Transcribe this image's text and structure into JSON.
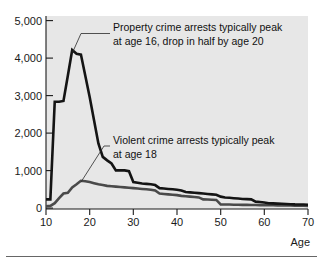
{
  "chart_data": {
    "type": "line",
    "title": "",
    "xlabel": "Age",
    "ylabel": "",
    "xlim": [
      10,
      70
    ],
    "ylim": [
      0,
      5000
    ],
    "grid": false,
    "legend_position": "none",
    "x_ticks": [
      "10",
      "20",
      "30",
      "40",
      "50",
      "60",
      "70"
    ],
    "x_tick_values": [
      10,
      20,
      30,
      40,
      50,
      60,
      70
    ],
    "y_ticks": [
      "0",
      "1,000",
      "2,000",
      "3,000",
      "4,000",
      "5,000"
    ],
    "y_tick_values": [
      0,
      1000,
      2000,
      3000,
      4000,
      5000
    ],
    "x": [
      10,
      11,
      12,
      13,
      14,
      15,
      16,
      17,
      18,
      19,
      20,
      21,
      22,
      23,
      24,
      25,
      26,
      27,
      28,
      29,
      30,
      31,
      32,
      33,
      34,
      35,
      36,
      37,
      38,
      39,
      40,
      41,
      42,
      43,
      44,
      45,
      46,
      47,
      48,
      49,
      50,
      51,
      52,
      53,
      54,
      55,
      56,
      57,
      58,
      59,
      60,
      61,
      62,
      63,
      64,
      65,
      66,
      67,
      68,
      69,
      70
    ],
    "series": [
      {
        "name": "Property crime arrests",
        "color": "#141414",
        "values": [
          250,
          250,
          2780,
          2780,
          2800,
          3450,
          4120,
          4020,
          4000,
          3450,
          2900,
          2300,
          1700,
          1350,
          1260,
          1180,
          1000,
          1000,
          1000,
          980,
          700,
          680,
          660,
          650,
          640,
          620,
          540,
          530,
          520,
          510,
          500,
          480,
          440,
          430,
          420,
          410,
          400,
          390,
          380,
          370,
          320,
          300,
          290,
          280,
          270,
          260,
          255,
          250,
          190,
          180,
          170,
          150,
          145,
          140,
          135,
          130,
          125,
          120,
          118,
          115,
          110
        ]
      },
      {
        "name": "Violent crime arrests",
        "color": "#4a4a4a",
        "values": [
          70,
          80,
          150,
          280,
          400,
          420,
          560,
          640,
          730,
          720,
          700,
          670,
          640,
          620,
          600,
          590,
          580,
          570,
          560,
          550,
          540,
          530,
          520,
          510,
          500,
          480,
          400,
          390,
          380,
          370,
          360,
          340,
          330,
          320,
          310,
          300,
          250,
          245,
          240,
          235,
          120,
          118,
          115,
          112,
          110,
          108,
          106,
          104,
          102,
          100,
          100,
          98,
          96,
          95,
          94,
          92,
          90,
          88,
          86,
          84,
          82
        ]
      }
    ],
    "annotations": [
      {
        "id": "property-annotation",
        "line1": "Property crime arrests typically peak",
        "line2": "at age 16, drop in half by age 20",
        "target_x": 16,
        "target_y": 4120
      },
      {
        "id": "violent-annotation",
        "line1": "Violent crime arrests typically peak",
        "line2": "at age 18",
        "target_x": 18,
        "target_y": 730
      }
    ]
  }
}
